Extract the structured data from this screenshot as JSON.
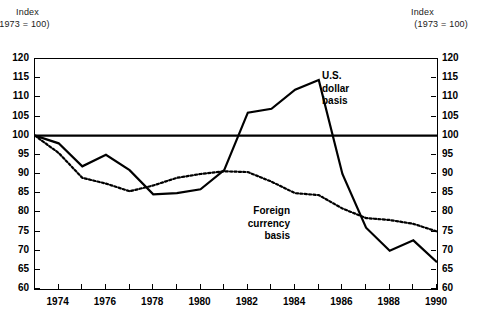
{
  "left_axis_note": {
    "line1": "Index",
    "line2": "(1973 = 100)"
  },
  "right_axis_note": {
    "line1": "Index",
    "line2": "(1973 = 100)"
  },
  "annotations": {
    "usd": {
      "line1": "U.S.",
      "line2": "dollar",
      "line3": "basis"
    },
    "foreign": {
      "line1": "Foreign",
      "line2": "currency",
      "line3": "basis"
    }
  },
  "chart_data": {
    "type": "line",
    "title": "",
    "subtitle": "",
    "xlabel": "",
    "ylabel": "Index (1973 = 100)",
    "xlim": [
      1973,
      1990
    ],
    "ylim": [
      60,
      120
    ],
    "yticks": [
      60,
      65,
      70,
      75,
      80,
      85,
      90,
      95,
      100,
      105,
      110,
      115,
      120
    ],
    "ytick_labels": [
      "60",
      "65",
      "70",
      "75",
      "80",
      "85",
      "90",
      "95",
      "100",
      "105",
      "110",
      "115",
      "120"
    ],
    "xticks": [
      1973,
      1974,
      1975,
      1976,
      1977,
      1978,
      1979,
      1980,
      1981,
      1982,
      1983,
      1984,
      1985,
      1986,
      1987,
      1988,
      1989,
      1990
    ],
    "xtick_labels": [
      "1974",
      "1976",
      "1978",
      "1980",
      "1982",
      "1984",
      "1986",
      "1988",
      "1990"
    ],
    "xtick_label_years": [
      1974,
      1976,
      1978,
      1980,
      1982,
      1984,
      1986,
      1988,
      1990
    ],
    "grid": false,
    "legend_position": "inline-annotations",
    "reference_line": {
      "value": 100,
      "style": "solid",
      "width": 2.2,
      "color": "#000000"
    },
    "x": [
      1973,
      1974,
      1975,
      1976,
      1977,
      1978,
      1979,
      1980,
      1981,
      1982,
      1983,
      1984,
      1985,
      1986,
      1987,
      1988,
      1989,
      1990
    ],
    "series": [
      {
        "name": "U.S. dollar basis",
        "style": "solid",
        "color": "#000000",
        "width": 2.2,
        "values": [
          100,
          98,
          92,
          95,
          91,
          84.7,
          85,
          86,
          91,
          106,
          107,
          112,
          114.5,
          90,
          76,
          70,
          72.7,
          67
        ]
      },
      {
        "name": "Foreign currency basis",
        "style": "dotted",
        "color": "#000000",
        "width": 2.2,
        "values": [
          100,
          95.5,
          89,
          87.5,
          85.5,
          87,
          89,
          90,
          90.7,
          90.5,
          88,
          85,
          84.5,
          81,
          78.5,
          78,
          77,
          75
        ]
      }
    ]
  }
}
